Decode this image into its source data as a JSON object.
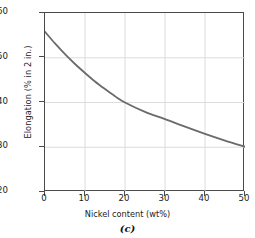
{
  "chart_data": {
    "type": "line",
    "title": "",
    "caption": "(c)",
    "xlabel": "Nickel content (wt%)",
    "ylabel": "Elongation (% in 2 in.)",
    "xlim": [
      0,
      50
    ],
    "ylim": [
      20,
      60
    ],
    "xticks": [
      0,
      10,
      20,
      30,
      40,
      50
    ],
    "yticks": [
      20,
      30,
      40,
      50,
      60
    ],
    "xtick_labels": [
      "0",
      "10",
      "20",
      "30",
      "40",
      "50"
    ],
    "ytick_labels": [
      "20",
      "30",
      "40",
      "50",
      "60"
    ],
    "grid": true,
    "legend": false,
    "series": [
      {
        "name": "Elongation",
        "color": "#6b6b6b",
        "linewidth": 1.8,
        "x": [
          0,
          2.5,
          5,
          7.5,
          10,
          12.5,
          15,
          17.5,
          20,
          25,
          30,
          35,
          40,
          45,
          50
        ],
        "y": [
          55.8,
          53.2,
          50.8,
          48.6,
          46.6,
          44.7,
          43.0,
          41.4,
          40.0,
          37.9,
          36.3,
          34.6,
          33.0,
          31.5,
          30.1
        ]
      }
    ]
  },
  "colors": {
    "curve": "#6b6b6b",
    "grid": "#d8d8d8",
    "axis": "#4a4a4a",
    "text": "#1a1a1a",
    "background": "#ffffff"
  }
}
